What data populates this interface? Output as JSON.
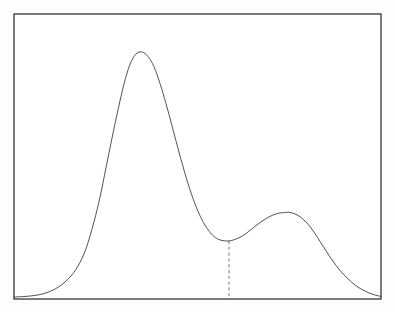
{
  "figure": {
    "title": "Bimodal probability density curve",
    "background_color": "#ffffff",
    "frame": {
      "name": "plot-frame",
      "stroke_color": "#1c1c1c",
      "stroke_width": 1.15,
      "x": 14,
      "y": 14,
      "width": 367,
      "height": 285
    },
    "curve": {
      "name": "density-curve",
      "stroke_color": "#4a4a4a",
      "stroke_width": 0.95,
      "fill": "none"
    },
    "divider": {
      "name": "valley-dashed-line",
      "stroke_color": "#6b6b6b",
      "stroke_width": 0.9,
      "dash_pattern": "3.2 2.6",
      "x": 229,
      "y_top": 233,
      "y_bottom": 298
    },
    "axis_labels": {
      "x": "",
      "y": "",
      "tick_labels_x": [],
      "tick_labels_y": []
    }
  },
  "chart_data": {
    "type": "line",
    "title": "",
    "subtitle": "",
    "xlabel": "",
    "ylabel": "",
    "legend": [],
    "legend_position": "none",
    "grid": false,
    "axis_visible": false,
    "tick_labels_x": [],
    "tick_labels_y": [],
    "xlim": [
      14,
      381
    ],
    "ylim": [
      0,
      1
    ],
    "annotations": [
      {
        "name": "valley-dashed-line",
        "type": "vline",
        "x": 229,
        "y_from": 0.0,
        "y_to": 0.232,
        "style": "dashed",
        "label": ""
      }
    ],
    "features": {
      "major_mode_x": 142,
      "major_mode_y": 1.0,
      "minor_mode_x": 290,
      "minor_mode_y": 0.348,
      "antimode_x": 229,
      "antimode_y": 0.232
    },
    "series": [
      {
        "name": "density",
        "x": [
          14,
          24,
          34,
          44,
          54,
          62,
          70,
          78,
          86,
          94,
          100,
          106,
          112,
          118,
          124,
          130,
          136,
          142,
          148,
          154,
          160,
          166,
          172,
          178,
          184,
          190,
          196,
          202,
          208,
          214,
          220,
          229,
          238,
          246,
          254,
          262,
          270,
          278,
          286,
          290,
          296,
          302,
          308,
          314,
          320,
          326,
          332,
          340,
          348,
          356,
          364,
          372,
          381
        ],
        "y": [
          0.004,
          0.006,
          0.01,
          0.018,
          0.034,
          0.055,
          0.085,
          0.13,
          0.2,
          0.31,
          0.41,
          0.53,
          0.65,
          0.765,
          0.87,
          0.95,
          0.992,
          1.0,
          0.982,
          0.94,
          0.872,
          0.79,
          0.7,
          0.608,
          0.52,
          0.44,
          0.372,
          0.318,
          0.278,
          0.25,
          0.236,
          0.232,
          0.243,
          0.262,
          0.288,
          0.312,
          0.332,
          0.344,
          0.348,
          0.348,
          0.34,
          0.324,
          0.3,
          0.268,
          0.23,
          0.192,
          0.155,
          0.112,
          0.078,
          0.05,
          0.03,
          0.016,
          0.006
        ]
      }
    ]
  }
}
